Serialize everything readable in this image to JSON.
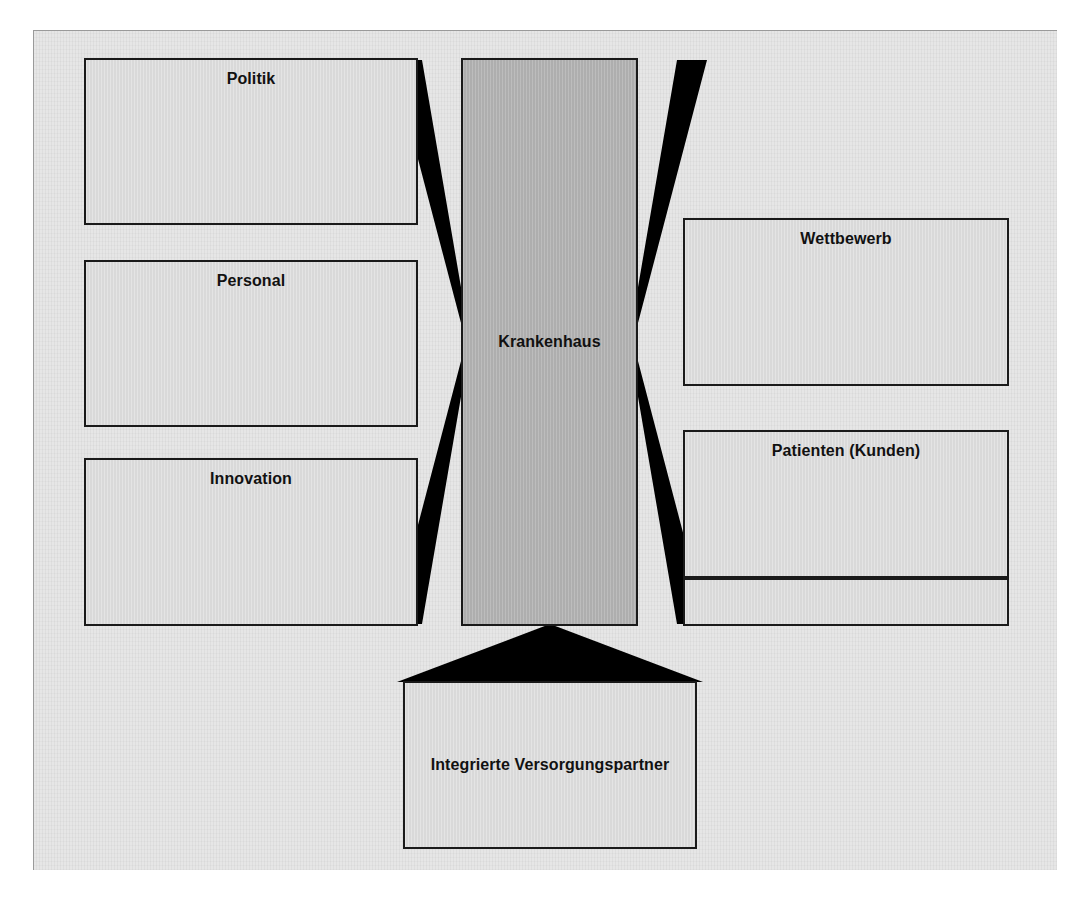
{
  "diagram": {
    "type": "stakeholder-relationship-diagram",
    "language": "de",
    "colors": {
      "paper": "#e6e6e6",
      "node_fill": "#d9d9d9",
      "center_node_fill": "#aeaeae",
      "stroke": "#1a1a1a",
      "arrow_fill": "#000000",
      "text": "#111111"
    },
    "center": {
      "id": "krankenhaus",
      "label": "Krankenhaus",
      "label_position": "middle"
    },
    "left_nodes": [
      {
        "id": "politik",
        "label": "Politik",
        "label_position": "top"
      },
      {
        "id": "personal",
        "label": "Personal",
        "label_position": "top"
      },
      {
        "id": "innovation",
        "label": "Innovation",
        "label_position": "top"
      }
    ],
    "right_nodes": [
      {
        "id": "wettbewerb",
        "label": "Wettbewerb",
        "label_position": "top"
      },
      {
        "id": "patienten",
        "label": "Patienten (Kunden)",
        "label_position": "top"
      },
      {
        "id": "extra",
        "label": "",
        "label_position": "top"
      }
    ],
    "bottom_nodes": [
      {
        "id": "versorgung",
        "label": "Integrierte Versorgungspartner",
        "label_position": "middle"
      }
    ],
    "connectors": [
      {
        "id": "arrow-left",
        "icon": "double-arrow-horizontal-icon",
        "orientation": "left-right"
      },
      {
        "id": "arrow-right",
        "icon": "double-arrow-horizontal-icon",
        "orientation": "right-left"
      },
      {
        "id": "arrow-bottom",
        "icon": "arrow-up-icon",
        "orientation": "bottom-up"
      }
    ]
  }
}
